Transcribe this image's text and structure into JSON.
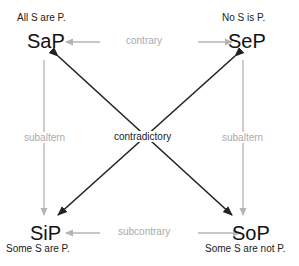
{
  "diagram": {
    "nodes": {
      "a": {
        "label": "SaP",
        "description": "All S are P."
      },
      "e": {
        "label": "SeP",
        "description": "No S is P."
      },
      "i": {
        "label": "SiP",
        "description": "Some S are P."
      },
      "o": {
        "label": "SoP",
        "description": "Some S are not P."
      }
    },
    "relations": {
      "top": "contrary",
      "bottom": "subcontrary",
      "left": "subaltern",
      "right": "subaltern",
      "diagonal": "contradictory"
    },
    "colors": {
      "strong_edge": "#222222",
      "weak_edge": "#b4b4b4",
      "weak_text": "#aaaaaa"
    }
  }
}
